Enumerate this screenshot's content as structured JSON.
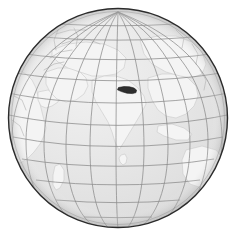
{
  "figure": {
    "type": "locator-globe",
    "title": "Nepal locator globe",
    "width": 237,
    "height": 235,
    "background_color": "#ffffff"
  },
  "globe": {
    "center_x": 118,
    "center_y": 118,
    "radius": 110,
    "ocean_color": "#e3e3e3",
    "land_color": "#f4f4f4",
    "land_stroke_color": "#c9c9c9",
    "outline_color": "#2b2b2b",
    "outline_width": 1.4,
    "inner_ring_color": "#8d8d8d",
    "shading": "soft radial highlight upper-left"
  },
  "projection": {
    "name": "orthographic",
    "center_latitude": 16,
    "center_longitude": 76,
    "units": "degrees"
  },
  "graticule": {
    "visible": true,
    "spacing_degrees": 15,
    "line_color": "#8a8a8a",
    "line_width": 0.75,
    "meridian_longitudes": [
      -15,
      0,
      15,
      30,
      45,
      60,
      75,
      90,
      105,
      120,
      135,
      150,
      165
    ],
    "parallel_latitudes": [
      -75,
      -60,
      -45,
      -30,
      -15,
      0,
      15,
      30,
      45,
      60,
      75
    ],
    "pole_visible": "north"
  },
  "highlight": {
    "name": "Nepal",
    "fill_color": "#2e2e2e",
    "stroke_color": "#1a1a1a",
    "latitude": 28.3,
    "longitude": 84.1,
    "shape": "elongated-sliver"
  },
  "landmasses": [
    {
      "name": "Africa",
      "label_visible": false
    },
    {
      "name": "Europe",
      "label_visible": false
    },
    {
      "name": "Asia",
      "label_visible": false
    },
    {
      "name": "Arabian Peninsula",
      "label_visible": false
    },
    {
      "name": "Indian subcontinent",
      "label_visible": false
    },
    {
      "name": "Sri Lanka",
      "label_visible": false
    },
    {
      "name": "Madagascar",
      "label_visible": false
    },
    {
      "name": "Australia",
      "label_visible": false
    },
    {
      "name": "Southeast Asia",
      "label_visible": false
    }
  ],
  "labels": {
    "visible": false,
    "items": []
  }
}
